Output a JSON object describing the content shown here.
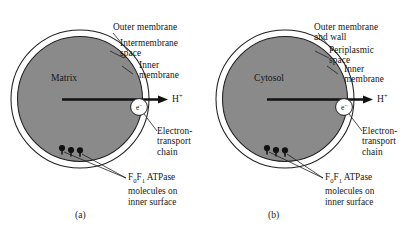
{
  "figure": {
    "background_color": "#ffffff",
    "ink_color": "#1a1a1a",
    "cell_fill_color": "#8a8a8a",
    "membrane_gap_color": "#ffffff"
  },
  "panels": [
    {
      "id": "a",
      "caption": "(a)",
      "interior_label": "Matrix",
      "electron_label": "e",
      "electron_charge": "−",
      "proton_label": "H",
      "proton_charge": "+",
      "labels": [
        {
          "name": "outer-membrane",
          "lines": [
            "Outer membrane"
          ]
        },
        {
          "name": "intermembrane-space",
          "lines": [
            "Intermembrane",
            "space"
          ]
        },
        {
          "name": "inner-membrane",
          "lines": [
            "Inner",
            "membrane"
          ]
        },
        {
          "name": "electron-transport-chain",
          "lines": [
            "Electron-",
            "transport",
            "chain"
          ]
        }
      ],
      "atpase": {
        "prefix": "F",
        "sub0": "0",
        "mid": "F",
        "sub1": "1",
        "suffix": " ATPase",
        "line2": "molecules on",
        "line3": "inner surface",
        "molecule_count": 3
      }
    },
    {
      "id": "b",
      "caption": "(b)",
      "interior_label": "Cytosol",
      "electron_label": "e",
      "electron_charge": "−",
      "proton_label": "H",
      "proton_charge": "+",
      "labels": [
        {
          "name": "outer-membrane-and-wall",
          "lines": [
            "Outer membrane",
            "and wall"
          ]
        },
        {
          "name": "periplasmic-space",
          "lines": [
            "Periplasmic",
            "space"
          ]
        },
        {
          "name": "inner-membrane",
          "lines": [
            "Inner",
            "membrane"
          ]
        },
        {
          "name": "electron-transport-chain",
          "lines": [
            "Electron-",
            "transport",
            "chain"
          ]
        }
      ],
      "atpase": {
        "prefix": "F",
        "sub0": "0",
        "mid": "F",
        "sub1": "1",
        "suffix": " ATPase",
        "line2": "molecules on",
        "line3": "inner surface",
        "molecule_count": 3
      }
    }
  ]
}
